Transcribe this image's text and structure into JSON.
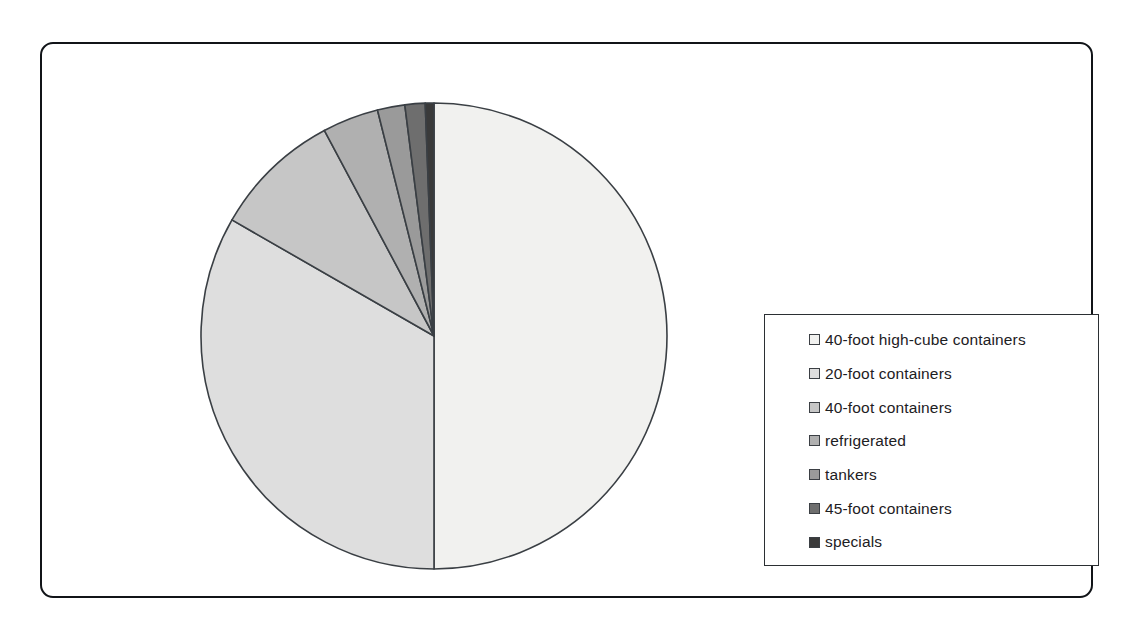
{
  "chart_data": {
    "type": "pie",
    "title": "",
    "subtitle": "",
    "xlabel": "",
    "ylabel": "",
    "grid": false,
    "legend_position": "right",
    "start_angle_deg": 0,
    "direction": "clockwise",
    "categories": [
      "40-foot high-cube containers",
      "20-foot containers",
      "40-foot containers",
      "refrigerated",
      "tankers",
      "45-foot containers",
      "specials"
    ],
    "values": [
      50.0,
      33.3,
      8.9,
      3.9,
      1.9,
      1.4,
      0.6
    ],
    "value_unit": "%",
    "colors": [
      "#f1f1ef",
      "#dedede",
      "#c6c6c6",
      "#b0b0b0",
      "#9a9a9a",
      "#6e6e6e",
      "#3a3a3a"
    ],
    "slice_edge_color": "#3a3f44",
    "slices": [
      {
        "label": "40-foot high-cube containers",
        "value": 50.0,
        "color": "#f1f1ef"
      },
      {
        "label": "20-foot containers",
        "value": 33.3,
        "color": "#dedede"
      },
      {
        "label": "40-foot containers",
        "value": 8.9,
        "color": "#c6c6c6"
      },
      {
        "label": "refrigerated",
        "value": 3.9,
        "color": "#b0b0b0"
      },
      {
        "label": "tankers",
        "value": 1.9,
        "color": "#9a9a9a"
      },
      {
        "label": "45-foot containers",
        "value": 1.4,
        "color": "#6e6e6e"
      },
      {
        "label": "specials",
        "value": 0.6,
        "color": "#3a3a3a"
      }
    ]
  },
  "legend": {
    "items": [
      {
        "label": "40-foot high-cube containers",
        "color": "#f1f1ef"
      },
      {
        "label": "20-foot containers",
        "color": "#dedede"
      },
      {
        "label": "40-foot containers",
        "color": "#c6c6c6"
      },
      {
        "label": "refrigerated",
        "color": "#b0b0b0"
      },
      {
        "label": "tankers",
        "color": "#9a9a9a"
      },
      {
        "label": "45-foot containers",
        "color": "#6e6e6e"
      },
      {
        "label": "specials",
        "color": "#3a3a3a"
      }
    ]
  },
  "frame": {
    "border_color": "#111418",
    "background": "#ffffff"
  }
}
